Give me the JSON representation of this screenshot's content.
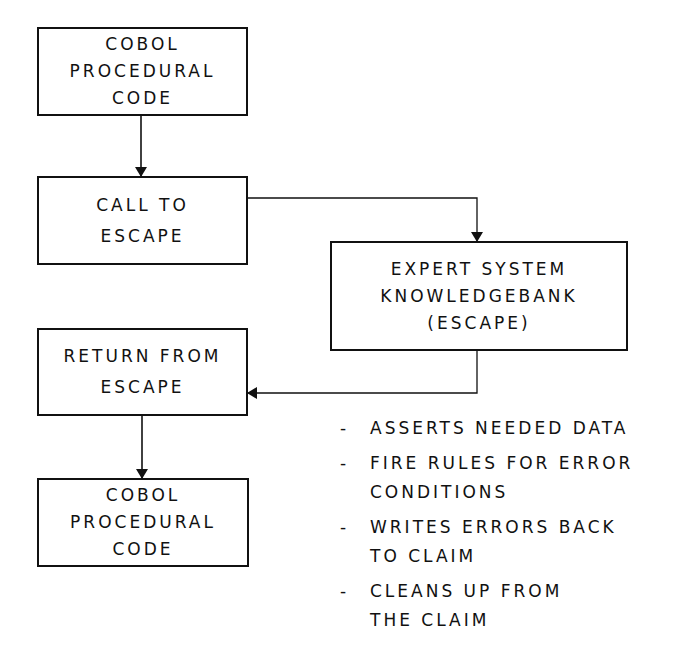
{
  "diagram": {
    "boxes": [
      {
        "id": "cobol-start",
        "lines": [
          "COBOL",
          "PROCEDURAL",
          "CODE"
        ]
      },
      {
        "id": "call-escape",
        "lines": [
          "CALL TO",
          "ESCAPE"
        ]
      },
      {
        "id": "expert-system",
        "lines": [
          "EXPERT SYSTEM",
          "KNOWLEDGEBANK",
          "(ESCAPE)"
        ]
      },
      {
        "id": "return-escape",
        "lines": [
          "RETURN FROM",
          "ESCAPE"
        ]
      },
      {
        "id": "cobol-end",
        "lines": [
          "COBOL",
          "PROCEDURAL",
          "CODE"
        ]
      }
    ],
    "edges": [
      {
        "from": "cobol-start",
        "to": "call-escape"
      },
      {
        "from": "call-escape",
        "to": "expert-system"
      },
      {
        "from": "expert-system",
        "to": "return-escape"
      },
      {
        "from": "return-escape",
        "to": "cobol-end"
      }
    ],
    "notes": {
      "bullet": "-",
      "items": [
        {
          "lines": [
            "ASSERTS NEEDED DATA"
          ]
        },
        {
          "lines": [
            "FIRE RULES FOR ERROR",
            "CONDITIONS"
          ]
        },
        {
          "lines": [
            "WRITES ERRORS BACK",
            "TO CLAIM"
          ]
        },
        {
          "lines": [
            "CLEANS UP FROM",
            "THE CLAIM"
          ]
        }
      ]
    },
    "colors": {
      "stroke": "#111111",
      "background": "#ffffff"
    }
  }
}
